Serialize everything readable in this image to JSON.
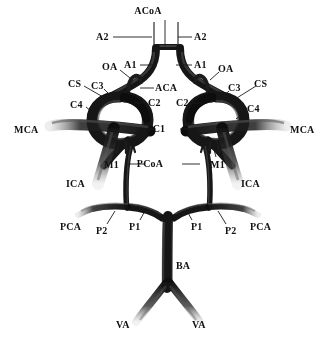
{
  "figure": {
    "type": "anatomical-diagram",
    "background_color": "#ffffff",
    "vessel_color": "#151515",
    "label_color": "#111111"
  },
  "labels": [
    {
      "id": "acoa",
      "text": "ACoA",
      "x": 148,
      "y": 6,
      "anchor": "center"
    },
    {
      "id": "a2-left",
      "text": "A2",
      "x": 96,
      "y": 32,
      "anchor": "left"
    },
    {
      "id": "a2-right",
      "text": "A2",
      "x": 194,
      "y": 32,
      "anchor": "left"
    },
    {
      "id": "a1-left",
      "text": "A1",
      "x": 124,
      "y": 60,
      "anchor": "left"
    },
    {
      "id": "a1-right",
      "text": "A1",
      "x": 194,
      "y": 60,
      "anchor": "left"
    },
    {
      "id": "oa-left",
      "text": "OA",
      "x": 102,
      "y": 62,
      "anchor": "left"
    },
    {
      "id": "oa-right",
      "text": "OA",
      "x": 218,
      "y": 64,
      "anchor": "left"
    },
    {
      "id": "cs-left",
      "text": "CS",
      "x": 68,
      "y": 79,
      "anchor": "left"
    },
    {
      "id": "cs-right",
      "text": "CS",
      "x": 254,
      "y": 79,
      "anchor": "left"
    },
    {
      "id": "c3-left",
      "text": "C3",
      "x": 91,
      "y": 81,
      "anchor": "left"
    },
    {
      "id": "c3-right",
      "text": "C3",
      "x": 228,
      "y": 83,
      "anchor": "left"
    },
    {
      "id": "aca",
      "text": "ACA",
      "x": 155,
      "y": 83,
      "anchor": "left"
    },
    {
      "id": "c4-left",
      "text": "C4",
      "x": 70,
      "y": 100,
      "anchor": "left"
    },
    {
      "id": "c4-right",
      "text": "C4",
      "x": 247,
      "y": 104,
      "anchor": "left"
    },
    {
      "id": "c2-left",
      "text": "C2",
      "x": 148,
      "y": 98,
      "anchor": "left"
    },
    {
      "id": "c2-right",
      "text": "C2",
      "x": 176,
      "y": 98,
      "anchor": "left"
    },
    {
      "id": "mca-left",
      "text": "MCA",
      "x": 14,
      "y": 125,
      "anchor": "left"
    },
    {
      "id": "mca-right",
      "text": "MCA",
      "x": 290,
      "y": 125,
      "anchor": "left"
    },
    {
      "id": "c1",
      "text": "C1",
      "x": 159,
      "y": 124,
      "anchor": "center"
    },
    {
      "id": "m1-left",
      "text": "M1",
      "x": 104,
      "y": 160,
      "anchor": "left"
    },
    {
      "id": "m1-right",
      "text": "M1",
      "x": 210,
      "y": 160,
      "anchor": "left"
    },
    {
      "id": "pcoa",
      "text": "PCoA",
      "x": 150,
      "y": 159,
      "anchor": "center"
    },
    {
      "id": "ica-left",
      "text": "ICA",
      "x": 66,
      "y": 179,
      "anchor": "left"
    },
    {
      "id": "ica-right",
      "text": "ICA",
      "x": 241,
      "y": 179,
      "anchor": "left"
    },
    {
      "id": "pca-left",
      "text": "PCA",
      "x": 60,
      "y": 222,
      "anchor": "left"
    },
    {
      "id": "pca-right",
      "text": "PCA",
      "x": 250,
      "y": 222,
      "anchor": "left"
    },
    {
      "id": "p2-left",
      "text": "P2",
      "x": 96,
      "y": 226,
      "anchor": "left"
    },
    {
      "id": "p2-right",
      "text": "P2",
      "x": 225,
      "y": 226,
      "anchor": "left"
    },
    {
      "id": "p1-left",
      "text": "P1",
      "x": 129,
      "y": 222,
      "anchor": "left"
    },
    {
      "id": "p1-right",
      "text": "P1",
      "x": 191,
      "y": 222,
      "anchor": "left"
    },
    {
      "id": "ba",
      "text": "BA",
      "x": 176,
      "y": 261,
      "anchor": "left"
    },
    {
      "id": "va-left",
      "text": "VA",
      "x": 116,
      "y": 320,
      "anchor": "left"
    },
    {
      "id": "va-right",
      "text": "VA",
      "x": 192,
      "y": 320,
      "anchor": "left"
    }
  ],
  "leaders": [
    {
      "id": "acoa",
      "d": "M165,20 L165,46"
    },
    {
      "id": "a2-left",
      "d": "M113,37 L152,37"
    },
    {
      "id": "a2-right",
      "d": "M192,37 L178,37"
    },
    {
      "id": "a1-left",
      "d": "M140,65 L157,65"
    },
    {
      "id": "a1-right",
      "d": "M192,65 L176,65"
    },
    {
      "id": "oa-left",
      "d": "M120,70 L130,78"
    },
    {
      "id": "oa-right",
      "d": "M219,72 L210,80"
    },
    {
      "id": "cs-left",
      "d": "M84,86 L110,101"
    },
    {
      "id": "cs-right",
      "d": "M256,86 L232,101"
    },
    {
      "id": "c3-left",
      "d": "M104,89 L112,97"
    },
    {
      "id": "c3-right",
      "d": "M229,91 L221,98"
    },
    {
      "id": "aca",
      "d": "M154,88 L140,88"
    },
    {
      "id": "c4-left",
      "d": "M86,107 L97,116"
    },
    {
      "id": "c4-right",
      "d": "M246,111 L236,119"
    },
    {
      "id": "c2-left",
      "d": "M147,103 L135,103"
    },
    {
      "id": "c2-right",
      "d": "M192,103 L203,103"
    },
    {
      "id": "c1-left",
      "d": "M156,129 L136,129"
    },
    {
      "id": "c1-right",
      "d": "M180,129 L200,129"
    },
    {
      "id": "m1-left",
      "d": "M114,157 L119,142"
    },
    {
      "id": "m1-right",
      "d": "M216,157 L212,142"
    },
    {
      "id": "pcoa-left",
      "d": "M144,164 L126,164"
    },
    {
      "id": "pcoa-right",
      "d": "M182,164 L200,164"
    },
    {
      "id": "p2-left",
      "d": "M107,224 L115,211"
    },
    {
      "id": "p2-right",
      "d": "M226,224 L218,211"
    },
    {
      "id": "p1-left",
      "d": "M140,220 L146,209"
    },
    {
      "id": "p1-right",
      "d": "M192,220 L186,209"
    }
  ]
}
